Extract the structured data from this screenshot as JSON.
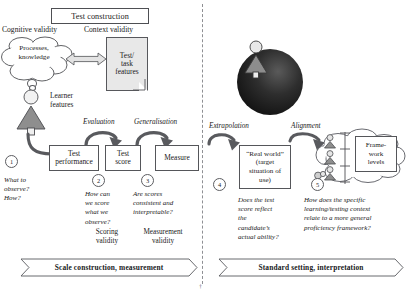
{
  "diagram": {
    "header": {
      "test_construction": "Test construction"
    },
    "left": {
      "cognitive_validity": "Cognitive validity",
      "context_validity": "Context validity",
      "thought_cloud_line1": "Processes,",
      "thought_cloud_line2": "knowledge",
      "doc_line1": "Test/",
      "doc_line2": "task",
      "doc_line3": "features",
      "learner_line1": "Learner",
      "learner_line2": "features",
      "arrow_labels": {
        "evaluation": "Evaluation",
        "generalisation": "Generalisation"
      },
      "boxes": [
        {
          "line1": "Test",
          "line2": "performance"
        },
        {
          "line1": "Test",
          "line2": "score"
        },
        {
          "line1": "Measure",
          "line2": ""
        }
      ],
      "steps": [
        {
          "number": "1",
          "question": "What to\nobserve?\nHow?",
          "validity": ""
        },
        {
          "number": "2",
          "question": "How can\nwe score\nwhat we\nobserve?",
          "validity": "Scoring\nvalidity"
        },
        {
          "number": "3",
          "question": "Are scores\nconsistent and\ninterpretable?",
          "validity": "Measurement\nvalidity"
        }
      ],
      "banner": "Scale construction, measurement"
    },
    "right": {
      "arrow_labels": {
        "extrapolation": "Extrapolation",
        "alignment": "Alignment"
      },
      "real_world_box": "“Real world”\n(target\nsituation of\nuse)",
      "framework_box": "Frame-\nwork\nlevels",
      "steps": [
        {
          "number": "4",
          "question": "Does the test\nscore reflect\nthe\ncandidate’s\nactual ability?"
        },
        {
          "number": "5",
          "question": "How does the specific\nlearning/testing context\nrelate to a more general\nproficiency framework?"
        }
      ],
      "banner": "Standard setting, interpretation"
    },
    "icons": {
      "thought_cloud": "thought-cloud-icon",
      "document": "document-icon",
      "learner_figure": "person-figure-icon",
      "globe": "globe-sphere-icon",
      "cloud": "cloud-icon",
      "double_arrow": "double-headed-arrow-icon",
      "curved_arrow": "curved-arrow-icon",
      "banner_arrow": "banner-arrow-icon",
      "scale_bar": "vertical-scale-icon"
    },
    "colors": {
      "ink": "#1a1a1a",
      "stroke": "#55565a",
      "fill_light": "#e8e8e8",
      "fill_mid": "#9a9a9a",
      "fill_dark": "#3a3a3a",
      "globe": "#2b2b2b",
      "banner_fill": "#ffffff"
    },
    "footer_mark": "†"
  }
}
